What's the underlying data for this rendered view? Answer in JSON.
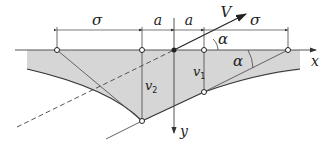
{
  "diagram": {
    "labels": {
      "sigma_left": "σ",
      "a_left": "a",
      "a_right": "a",
      "sigma_right": "σ",
      "velocity": "V",
      "alpha_top": "α",
      "alpha_bottom": "α",
      "x_axis": "x",
      "y_axis": "y",
      "v2_main": "v",
      "v2_sub": "2",
      "v1_main": "v",
      "v1_sub": "1"
    },
    "colors": {
      "fill": "#d6d6d6",
      "line": "#333333",
      "thin_line": "#555555"
    }
  }
}
